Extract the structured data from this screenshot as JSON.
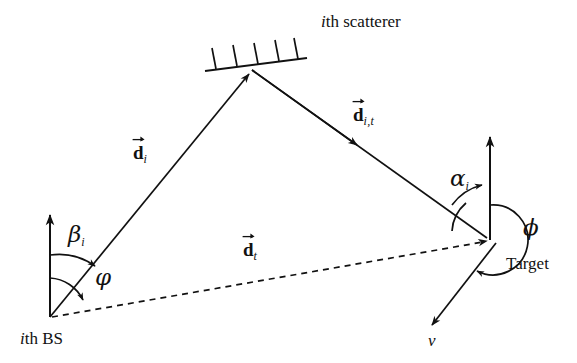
{
  "figure": {
    "background_color": "#ffffff",
    "line_color": "#111111",
    "width": 577,
    "height": 363
  },
  "nodes": {
    "bs": {
      "label_prefix": "i",
      "label_rest": "th BS",
      "x": 50,
      "y": 317
    },
    "scatterer": {
      "label_prefix": "i",
      "label_rest": "th scatterer",
      "x": 248,
      "y": 68
    },
    "target": {
      "label": "Target",
      "x": 490,
      "y": 240
    }
  },
  "vectors": [
    {
      "name": "d_i",
      "symbol": "d",
      "subscript": "i",
      "from": "bs",
      "to": "scatterer",
      "style": "solid",
      "label_x": 133,
      "label_y": 143
    },
    {
      "name": "d_i_t",
      "symbol": "d",
      "subscript": "i,t",
      "from": "scatterer",
      "to": "target",
      "style": "solid",
      "label_x": 353,
      "label_y": 105
    },
    {
      "name": "d_t",
      "symbol": "d",
      "subscript": "t",
      "from": "bs",
      "to": "target",
      "style": "dashed",
      "label_x": 243,
      "label_y": 240
    }
  ],
  "angles": [
    {
      "name": "beta_i",
      "symbol": "β",
      "subscript": "i",
      "at": "bs",
      "between": [
        "north-reference",
        "d_i"
      ],
      "label_x": 68,
      "label_y": 223
    },
    {
      "name": "phi_small",
      "symbol": "φ",
      "subscript": "",
      "at": "bs",
      "between": [
        "north-reference",
        "d_t"
      ],
      "label_x": 95,
      "label_y": 272
    },
    {
      "name": "alpha_i",
      "symbol": "α",
      "subscript": "i",
      "at": "target",
      "between": [
        "d_i_t",
        "north-reference"
      ],
      "label_x": 450,
      "label_y": 167
    },
    {
      "name": "phi",
      "symbol": "ϕ",
      "subscript": "",
      "at": "target",
      "between": [
        "north-reference",
        "velocity"
      ],
      "label_x": 523,
      "label_y": 222
    }
  ],
  "velocity": {
    "label": "v",
    "from": "target",
    "label_x": 430,
    "label_y": 338
  },
  "reference_axes": [
    {
      "name": "bs-north-axis",
      "x": 50,
      "y_top": 208,
      "y_bottom": 317
    },
    {
      "name": "target-north-axis",
      "x": 490,
      "y_top": 130,
      "y_bottom": 240
    }
  ],
  "scatterer_surface": {
    "hatch_count": 5,
    "x1": 205,
    "y1": 71,
    "x2": 307,
    "y2": 58
  }
}
